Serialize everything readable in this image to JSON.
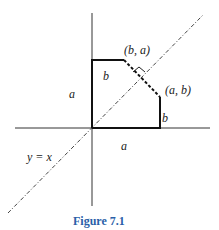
{
  "figure": {
    "caption": "Figure 7.1",
    "caption_color": "#2a5fa8",
    "labels": {
      "point_ba": "(b, a)",
      "point_ab": "(a, b)",
      "left_side": "a",
      "bottom_side": "a",
      "top_side": "b",
      "right_side": "b",
      "diagonal": "y = x"
    },
    "geometry": {
      "origin": [
        92,
        128
      ],
      "point_ba": [
        124,
        60
      ],
      "point_ab": [
        160,
        97
      ],
      "square_corner": [
        160,
        60
      ],
      "diagonal_start": [
        8,
        213
      ],
      "diagonal_end": [
        203,
        15
      ]
    }
  }
}
